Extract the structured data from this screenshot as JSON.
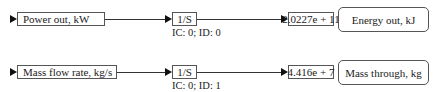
{
  "rows": [
    {
      "input_label": "Power out, kW",
      "integrator_label": "1/S",
      "integrator_params": "IC: 0; ID: 0",
      "display_value": "2.0227e + 11",
      "output_label": "Energy out, kJ"
    },
    {
      "input_label": "Mass flow rate, kg/s",
      "integrator_label": "1/S",
      "integrator_params": "IC: 0; ID: 1",
      "display_value": "4.416e + 7",
      "output_label": "Mass through, kg"
    }
  ]
}
